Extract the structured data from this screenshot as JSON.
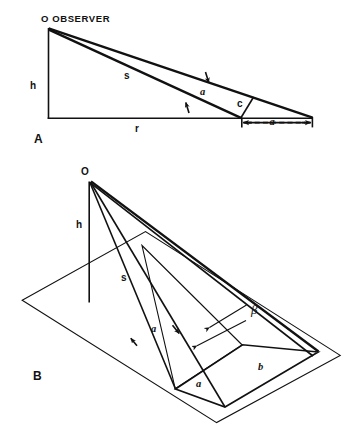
{
  "figure": {
    "background_color": "#ffffff",
    "ink_color": "#111111",
    "panels": [
      {
        "id": "A",
        "label": "A",
        "caption": "O OBSERVER",
        "observer_point_label": "O",
        "observer_word": "OBSERVER",
        "view": "side elevation",
        "labels": {
          "height": "h",
          "ground_range": "r",
          "slant_range": "s",
          "angular_extent": "a",
          "depression_angle": "c",
          "footprint_length": "a"
        }
      },
      {
        "id": "B",
        "label": "B",
        "observer_point_label": "O",
        "view": "oblique perspective",
        "labels": {
          "height": "h",
          "slant_range": "s",
          "angular_extent": "a",
          "azimuth_angle": "β",
          "footprint_width": "b",
          "footprint_length": "a"
        }
      }
    ],
    "symbols": [
      {
        "name": "h",
        "meaning": "observer height above ground plane"
      },
      {
        "name": "r",
        "meaning": "horizontal ground range"
      },
      {
        "name": "s",
        "meaning": "slant range from observer"
      },
      {
        "name": "a",
        "meaning": "angular extent / footprint length"
      },
      {
        "name": "b",
        "meaning": "footprint width"
      },
      {
        "name": "c",
        "meaning": "grazing angle at surface"
      },
      {
        "name": "β",
        "meaning": "beam azimuth angle"
      }
    ]
  }
}
